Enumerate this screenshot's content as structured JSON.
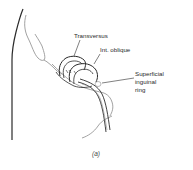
{
  "figure": {
    "labels": {
      "transversus": "Transversus",
      "int_oblique": "Int. oblique",
      "superficial_ring_line1": "Superficial",
      "superficial_ring_line2": "inguinal",
      "superficial_ring_line3": "ring"
    },
    "caption": "(a)"
  },
  "colors": {
    "line": "#2b2b2b",
    "light_line": "#8a8a8a",
    "background": "#ffffff"
  }
}
